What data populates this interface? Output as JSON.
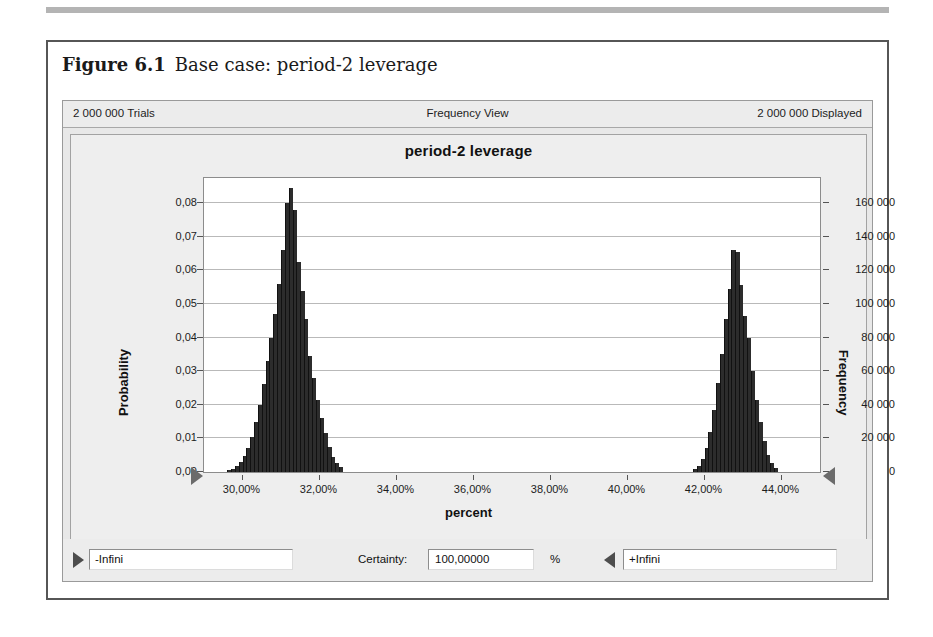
{
  "figure": {
    "label": "Figure 6.1",
    "caption": "Base case: period-2 leverage"
  },
  "window": {
    "status": {
      "trials": "2 000 000 Trials",
      "view": "Frequency View",
      "displayed": "2 000 000 Displayed"
    },
    "controls": {
      "lower_bound_value": "-Infini",
      "certainty_label": "Certainty:",
      "certainty_value": "100,00000",
      "percent_sign": "%",
      "upper_bound_value": "+Infini",
      "left_arrow_icon": "play-right-triangle-icon",
      "right_arrow_icon": "play-left-triangle-icon"
    }
  },
  "chart_data": {
    "type": "bar",
    "title": "period-2 leverage",
    "xlabel": "percent",
    "ylabel": "Probability",
    "y2label": "Frequency",
    "grid": true,
    "legend": "none",
    "xlim": [
      29.0,
      45.0
    ],
    "ylim": [
      0,
      0.0875
    ],
    "y2lim": [
      0,
      175000
    ],
    "xticks": [
      "30,00%",
      "32,00%",
      "34,00%",
      "36,00%",
      "38,00%",
      "40,00%",
      "42,00%",
      "44,00%"
    ],
    "xtick_values": [
      30,
      32,
      34,
      36,
      38,
      40,
      42,
      44
    ],
    "yticks": [
      "0,00",
      "0,01",
      "0,02",
      "0,03",
      "0,04",
      "0,05",
      "0,06",
      "0,07",
      "0,08"
    ],
    "ytick_values": [
      0,
      0.01,
      0.02,
      0.03,
      0.04,
      0.05,
      0.06,
      0.07,
      0.08
    ],
    "y2ticks": [
      "0",
      "20 000",
      "40 000",
      "60 000",
      "80 000",
      "100 000",
      "120 000",
      "140 000",
      "160 000"
    ],
    "y2tick_values": [
      0,
      20000,
      40000,
      60000,
      80000,
      100000,
      120000,
      140000,
      160000
    ],
    "bin_width": 0.1,
    "x": [
      29.6,
      29.7,
      29.8,
      29.9,
      30.0,
      30.1,
      30.2,
      30.3,
      30.4,
      30.5,
      30.6,
      30.7,
      30.8,
      30.9,
      31.0,
      31.1,
      31.2,
      31.3,
      31.4,
      31.5,
      31.6,
      31.7,
      31.8,
      31.9,
      32.0,
      32.1,
      32.2,
      32.3,
      32.4,
      32.5,
      41.7,
      41.8,
      41.9,
      42.0,
      42.1,
      42.2,
      42.3,
      42.4,
      42.5,
      42.6,
      42.7,
      42.8,
      42.9,
      43.0,
      43.1,
      43.2,
      43.3,
      43.4,
      43.5,
      43.6,
      43.7,
      43.8
    ],
    "values": [
      0.0005,
      0.001,
      0.0018,
      0.003,
      0.0048,
      0.0072,
      0.0105,
      0.0148,
      0.02,
      0.0262,
      0.033,
      0.04,
      0.047,
      0.056,
      0.066,
      0.08,
      0.0845,
      0.078,
      0.0625,
      0.054,
      0.0455,
      0.0345,
      0.028,
      0.0215,
      0.016,
      0.0115,
      0.0075,
      0.0046,
      0.0028,
      0.0014,
      0.0008,
      0.0018,
      0.0038,
      0.0072,
      0.012,
      0.0186,
      0.0265,
      0.035,
      0.0455,
      0.0545,
      0.066,
      0.0655,
      0.0558,
      0.0465,
      0.04,
      0.03,
      0.0215,
      0.015,
      0.0092,
      0.0052,
      0.0026,
      0.0011
    ],
    "series_color": "#2c2c2c",
    "grabber_left_icon": "range-handle-right-triangle-icon",
    "grabber_right_icon": "range-handle-left-triangle-icon"
  }
}
